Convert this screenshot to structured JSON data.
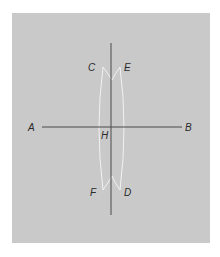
{
  "diagram": {
    "type": "perpendicular-bisector-construction",
    "colors": {
      "background": "#c9c9c9",
      "line": "#4a4a4a",
      "arc": "#f2f2f2",
      "label": "#2a2a2a"
    },
    "segment": {
      "start_label": "A",
      "end_label": "B"
    },
    "bisector": {
      "intersection_label": "H"
    },
    "arcs": {
      "upper_left_label": "C",
      "upper_right_label": "E",
      "lower_left_label": "F",
      "lower_right_label": "D"
    }
  }
}
